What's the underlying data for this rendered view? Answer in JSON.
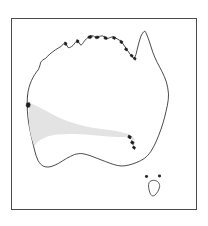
{
  "figure": {
    "type": "distribution-map",
    "region": "Australia",
    "title": "",
    "caption": "",
    "has_text_labels": false,
    "frame": {
      "visible": true,
      "color": "#4a4a4a",
      "line_width_px": 1.6,
      "x": 11,
      "y": 18,
      "width": 186,
      "height": 192
    },
    "background_color": "#ffffff"
  },
  "map": {
    "name": "australia-outline",
    "coastline_color": "#2b2b2b",
    "coastline_width_px": 0.85,
    "land_fill": "#ffffff",
    "landmasses": [
      {
        "name": "mainland-australia",
        "label": ""
      },
      {
        "name": "tasmania",
        "label": ""
      }
    ],
    "features": [
      {
        "name": "cape-york-peninsula",
        "label": ""
      },
      {
        "name": "gulf-of-carpentaria",
        "label": ""
      },
      {
        "name": "arnhem-land",
        "label": ""
      },
      {
        "name": "great-australian-bight",
        "label": ""
      },
      {
        "name": "eyre-peninsula",
        "label": ""
      },
      {
        "name": "spencer-gulf",
        "label": ""
      },
      {
        "name": "bass-strait",
        "label": ""
      }
    ]
  },
  "distribution": {
    "name": "species-range",
    "shade_color": "#e3e3e3",
    "shade_opacity": 1,
    "description": "",
    "areas": [
      {
        "name": "southwest-primary-range",
        "label": "",
        "region": "South-west Western Australia extending east along the southern coast"
      },
      {
        "name": "eyre-peninsula-outlier",
        "label": "",
        "region": "Small detached patch near Eyre Peninsula, South Australia"
      }
    ]
  },
  "legend": {
    "visible": false,
    "items": []
  },
  "scale_bar": {
    "visible": false,
    "label": ""
  },
  "north_arrow": {
    "visible": false,
    "label": ""
  }
}
